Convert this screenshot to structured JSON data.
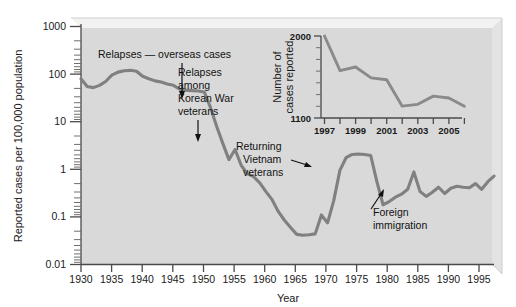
{
  "figure": {
    "name": "measles-incidence-chart",
    "background_color": "#ffffff",
    "plot_fill": "#d8d8d8",
    "line_color": "#808080"
  },
  "main_axis": {
    "ylabel": "Reported cases per 100,000 population",
    "xlabel": "Year",
    "y_tick_labels": [
      "1000",
      "100",
      "10",
      "1",
      "0.1",
      "0.01"
    ],
    "x_tick_labels": [
      "1930",
      "1935",
      "1940",
      "1945",
      "1950",
      "1955",
      "1960",
      "1965",
      "1970",
      "1975",
      "1980",
      "1985",
      "1990",
      "1995"
    ]
  },
  "annotations": [
    {
      "id": "relapses-overseas",
      "text": "Relapses — overseas cases"
    },
    {
      "id": "relapses-korean",
      "line1": "Relapses",
      "line2": "among",
      "line3": "Korean War",
      "line4": "veterans"
    },
    {
      "id": "returning-vietnam",
      "line1": "Returning",
      "line2": "Vietnam",
      "line3": "veterans"
    },
    {
      "id": "foreign-immigration",
      "line1": "Foreign",
      "line2": "immigration"
    }
  ],
  "inset": {
    "ylabel_line1": "Number of",
    "ylabel_line2": "cases reported",
    "y_tick_labels": [
      "2000",
      "1100"
    ],
    "x_tick_labels": [
      "1997",
      "1999",
      "2001",
      "2003",
      "2005"
    ]
  },
  "chart_data": [
    {
      "type": "line",
      "id": "main-chart",
      "title": "",
      "xlabel": "Year",
      "ylabel": "Reported cases per 100,000 population",
      "yscale": "log",
      "ylim": [
        0.01,
        1000
      ],
      "xlim": [
        1930,
        1997
      ],
      "grid": false,
      "legend": "none",
      "series": [
        {
          "name": "Reported cases per 100,000 population",
          "x": [
            1930,
            1931,
            1932,
            1933,
            1934,
            1935,
            1936,
            1937,
            1938,
            1939,
            1940,
            1941,
            1942,
            1943,
            1944,
            1945,
            1946,
            1947,
            1948,
            1949,
            1950,
            1951,
            1952,
            1953,
            1954,
            1955,
            1956,
            1957,
            1958,
            1959,
            1960,
            1961,
            1962,
            1963,
            1964,
            1965,
            1966,
            1967,
            1968,
            1969,
            1970,
            1971,
            1972,
            1973,
            1974,
            1975,
            1976,
            1977,
            1978,
            1979,
            1980,
            1981,
            1982,
            1983,
            1984,
            1985,
            1986,
            1987,
            1988,
            1989,
            1990,
            1991,
            1992,
            1993,
            1994,
            1995,
            1996,
            1997
          ],
          "y": [
            80,
            55,
            52,
            58,
            70,
            95,
            110,
            118,
            120,
            115,
            90,
            80,
            72,
            68,
            62,
            58,
            48,
            46,
            45,
            44,
            42,
            20,
            8.0,
            3.5,
            1.6,
            2.6,
            1.2,
            0.8,
            0.7,
            0.52,
            0.34,
            0.23,
            0.13,
            0.085,
            0.06,
            0.043,
            0.041,
            0.042,
            0.044,
            0.11,
            0.075,
            0.22,
            0.95,
            1.75,
            2.05,
            2.1,
            2.05,
            1.95,
            0.55,
            0.18,
            0.21,
            0.26,
            0.3,
            0.38,
            0.88,
            0.34,
            0.27,
            0.33,
            0.42,
            0.31,
            0.4,
            0.44,
            0.42,
            0.41,
            0.5,
            0.38,
            0.55,
            0.72
          ]
        }
      ]
    },
    {
      "type": "line",
      "id": "inset-chart",
      "title": "",
      "xlabel": "",
      "ylabel": "Number of cases reported",
      "yscale": "linear",
      "ylim": [
        1100,
        2000
      ],
      "xlim": [
        1997,
        2006
      ],
      "grid": false,
      "legend": "none",
      "series": [
        {
          "name": "Number of cases reported",
          "x": [
            1997,
            1998,
            1999,
            2000,
            2001,
            2002,
            2003,
            2004,
            2005,
            2006
          ],
          "y": [
            2000,
            1620,
            1660,
            1540,
            1520,
            1230,
            1250,
            1340,
            1320,
            1230
          ]
        }
      ]
    }
  ]
}
